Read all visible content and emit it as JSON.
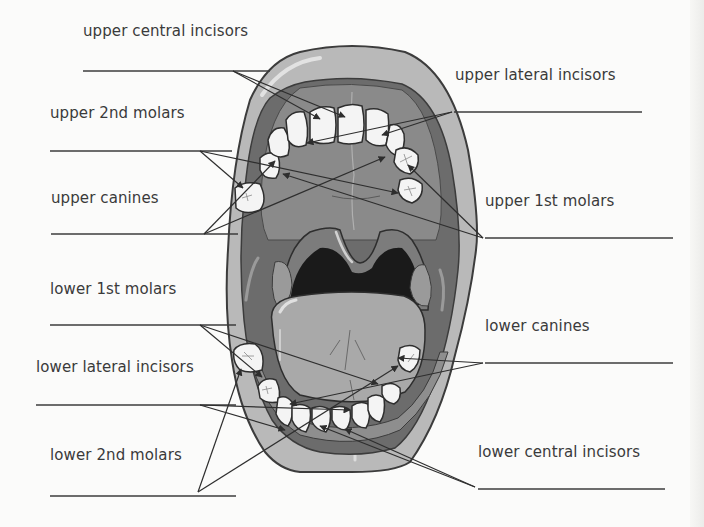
{
  "diagram": {
    "colors": {
      "background": "#fbfbfa",
      "outer_lip": "#b9b9b9",
      "lip_outline": "#3c3c3c",
      "gum": "#8e8e8e",
      "palate": "#7a7a7a",
      "inner_mouth": "#6c6c6c",
      "throat": "#1a1a1a",
      "tongue": "#a9a9a9",
      "tooth": "#f4f4f4",
      "tonsil": "#9a9a9a",
      "text": "#3a3a3a",
      "line": "#3c3c3c"
    }
  },
  "labels": [
    {
      "id": "upper-central-incisors",
      "text": "upper central incisors",
      "x": 83,
      "y": 22
    },
    {
      "id": "upper-lateral-incisors",
      "text": "upper lateral incisors",
      "x": 455,
      "y": 66
    },
    {
      "id": "upper-2nd-molars",
      "text": "upper 2nd molars",
      "x": 50,
      "y": 104
    },
    {
      "id": "upper-canines",
      "text": "upper canines",
      "x": 51,
      "y": 189
    },
    {
      "id": "upper-1st-molars",
      "text": "upper 1st molars",
      "x": 485,
      "y": 192
    },
    {
      "id": "lower-1st-molars",
      "text": "lower 1st molars",
      "x": 50,
      "y": 280
    },
    {
      "id": "lower-canines",
      "text": "lower canines",
      "x": 485,
      "y": 317
    },
    {
      "id": "lower-lateral-incisors",
      "text": "lower lateral incisors",
      "x": 36,
      "y": 358
    },
    {
      "id": "lower-2nd-molars",
      "text": "lower 2nd molars",
      "x": 50,
      "y": 446
    },
    {
      "id": "lower-central-incisors",
      "text": "lower central incisors",
      "x": 478,
      "y": 443
    }
  ],
  "answer_lines": [
    {
      "id": "upper-central-incisors",
      "x1": 83,
      "y1": 71,
      "x2": 270,
      "y2": 71
    },
    {
      "id": "upper-lateral-incisors",
      "x1": 454,
      "y1": 112,
      "x2": 642,
      "y2": 112
    },
    {
      "id": "upper-2nd-molars",
      "x1": 50,
      "y1": 151,
      "x2": 232,
      "y2": 151
    },
    {
      "id": "upper-canines",
      "x1": 51,
      "y1": 234,
      "x2": 238,
      "y2": 234
    },
    {
      "id": "upper-1st-molars",
      "x1": 485,
      "y1": 238,
      "x2": 673,
      "y2": 238
    },
    {
      "id": "lower-1st-molars",
      "x1": 50,
      "y1": 325,
      "x2": 236,
      "y2": 325
    },
    {
      "id": "lower-canines",
      "x1": 485,
      "y1": 363,
      "x2": 673,
      "y2": 363
    },
    {
      "id": "lower-lateral-incisors",
      "x1": 36,
      "y1": 405,
      "x2": 236,
      "y2": 405
    },
    {
      "id": "lower-2nd-molars",
      "x1": 50,
      "y1": 496,
      "x2": 236,
      "y2": 496
    },
    {
      "id": "lower-central-incisors",
      "x1": 478,
      "y1": 489,
      "x2": 665,
      "y2": 489
    }
  ],
  "pointers": [
    {
      "id": "upper-central-incisors",
      "from": [
        233,
        71
      ],
      "to": [
        [
          320,
          119
        ],
        [
          345,
          117
        ]
      ]
    },
    {
      "id": "upper-lateral-incisors",
      "from": [
        452,
        112
      ],
      "to": [
        [
          307,
          143
        ],
        [
          382,
          135
        ]
      ]
    },
    {
      "id": "upper-2nd-molars",
      "from": [
        200,
        151
      ],
      "to": [
        [
          243,
          188
        ],
        [
          398,
          193
        ]
      ]
    },
    {
      "id": "upper-canines",
      "from": [
        204,
        234
      ],
      "to": [
        [
          275,
          161
        ],
        [
          385,
          157
        ]
      ]
    },
    {
      "id": "upper-1st-molars",
      "from": [
        483,
        238
      ],
      "to": [
        [
          283,
          174
        ],
        [
          408,
          165
        ]
      ]
    },
    {
      "id": "lower-1st-molars",
      "from": [
        200,
        325
      ],
      "to": [
        [
          262,
          377
        ],
        [
          378,
          384
        ]
      ]
    },
    {
      "id": "lower-canines",
      "from": [
        483,
        363
      ],
      "to": [
        [
          290,
          404
        ],
        [
          398,
          358
        ]
      ]
    },
    {
      "id": "lower-lateral-incisors",
      "from": [
        200,
        405
      ],
      "to": [
        [
          285,
          430
        ],
        [
          350,
          410
        ]
      ]
    },
    {
      "id": "lower-2nd-molars",
      "from": [
        198,
        492
      ],
      "to": [
        [
          241,
          369
        ],
        [
          398,
          366
        ]
      ]
    },
    {
      "id": "lower-central-incisors",
      "from": [
        475,
        487
      ],
      "to": [
        [
          320,
          426
        ],
        [
          345,
          429
        ]
      ]
    }
  ]
}
